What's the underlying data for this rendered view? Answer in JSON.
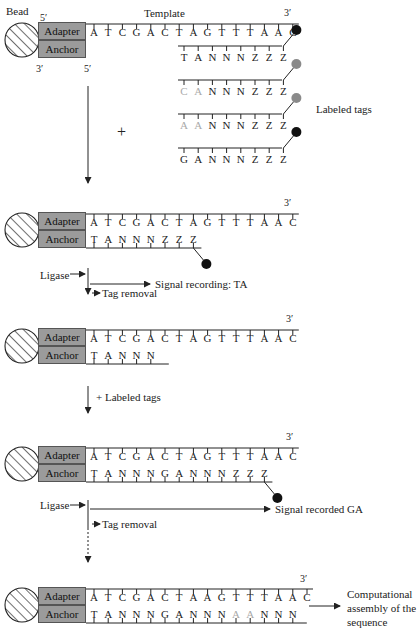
{
  "labels": {
    "bead": "Bead",
    "template": "Template",
    "adapter": "Adapter",
    "anchor": "Anchor",
    "five_prime": "5′",
    "three_prime": "3′",
    "labeled_tags": "Labeled tags",
    "plus": "+",
    "ligase": "Ligase",
    "signal_recording_ta": "Signal recording: TA",
    "tag_removal": "Tag removal",
    "plus_labeled_tags": "+ Labeled tags",
    "signal_recorded_ga": "Signal recorded GA",
    "computational_assembly_1": "Computational",
    "computational_assembly_2": "assembly of the",
    "computational_assembly_3": "sequence"
  },
  "colors": {
    "ink": "#222222",
    "adapter_fill": "#9b9b9b",
    "gray_label": "#8a8a8a",
    "light_base": "#aaaaaa",
    "black_label": "#111111"
  },
  "steps": [
    {
      "template": [
        "A",
        "T",
        "C",
        "G",
        "A",
        "C",
        "T",
        "A",
        "G",
        "T",
        "T",
        "T",
        "A",
        "A",
        "C"
      ],
      "anchor": []
    },
    {
      "template": [
        "A",
        "T",
        "C",
        "G",
        "A",
        "C",
        "T",
        "A",
        "G",
        "T",
        "T",
        "T",
        "A",
        "A",
        "C"
      ],
      "anchor": [
        "T",
        "A",
        "N",
        "N",
        "N",
        "Z",
        "Z",
        "Z"
      ],
      "label_color": "black"
    },
    {
      "template": [
        "A",
        "T",
        "C",
        "G",
        "A",
        "C",
        "T",
        "A",
        "G",
        "T",
        "T",
        "T",
        "A",
        "A",
        "C"
      ],
      "anchor": [
        "T",
        "A",
        "N",
        "N",
        "N"
      ]
    },
    {
      "template": [
        "A",
        "T",
        "C",
        "G",
        "A",
        "C",
        "T",
        "A",
        "G",
        "T",
        "T",
        "T",
        "A",
        "A",
        "C"
      ],
      "anchor": [
        "T",
        "A",
        "N",
        "N",
        "N",
        "G",
        "A",
        "N",
        "N",
        "N",
        "Z",
        "Z",
        "Z"
      ],
      "label_color": "black"
    },
    {
      "template": [
        "A",
        "T",
        "C",
        "G",
        "A",
        "C",
        "T",
        "A",
        "A",
        "G",
        "T",
        "T",
        "T",
        "A",
        "A",
        "C"
      ],
      "anchor": [
        "T",
        "A",
        "N",
        "N",
        "N",
        "G",
        "A",
        "N",
        "N",
        "N",
        "A",
        "A",
        "N",
        "N",
        "N"
      ],
      "light_indices": [
        10,
        11
      ]
    }
  ],
  "tags": [
    {
      "bases": [
        "T",
        "A",
        "N",
        "N",
        "N",
        "Z",
        "Z",
        "Z"
      ],
      "label_color": "black",
      "light_indices": []
    },
    {
      "bases": [
        "C",
        "A",
        "N",
        "N",
        "N",
        "Z",
        "Z",
        "Z"
      ],
      "label_color": "gray",
      "light_indices": [
        0,
        1
      ]
    },
    {
      "bases": [
        "A",
        "A",
        "N",
        "N",
        "N",
        "Z",
        "Z",
        "Z"
      ],
      "label_color": "gray",
      "light_indices": [
        0,
        1
      ]
    },
    {
      "bases": [
        "G",
        "A",
        "N",
        "N",
        "N",
        "Z",
        "Z",
        "Z"
      ],
      "label_color": "black",
      "light_indices": []
    }
  ]
}
